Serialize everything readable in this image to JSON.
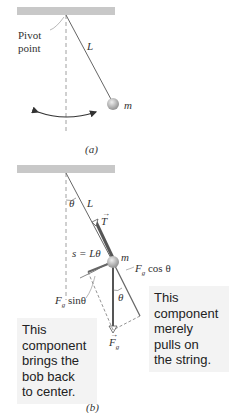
{
  "figure_a": {
    "pivot_label_line1": "Pivot",
    "pivot_label_line2": "point",
    "length_label": "L",
    "mass_label": "m",
    "caption": "(a)"
  },
  "figure_b": {
    "angle_label_top": "θ",
    "length_label": "L",
    "tension_label": "T",
    "arc_label": "s = Lθ",
    "mass_label": "m",
    "cos_component_label": "F",
    "cos_component_sub": "g",
    "cos_component_suffix": " cos θ",
    "sin_component_label": "F",
    "sin_component_sub": "g",
    "sin_component_suffix": " sinθ",
    "angle_label_bottom": "θ",
    "gravity_label": "F",
    "gravity_sub": "g",
    "caption": "(b)",
    "left_note": [
      "This",
      "component",
      "brings the",
      "bob back",
      "to center."
    ],
    "right_note": [
      "This",
      "component",
      "merely",
      "pulls on",
      "the string."
    ]
  },
  "colors": {
    "ceiling": "#c8c8c8",
    "string": "#666666",
    "tension_arrow": "#555555",
    "note_bg": "#f3f3f3"
  }
}
